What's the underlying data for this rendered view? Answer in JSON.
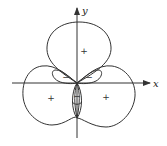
{
  "diagram": {
    "type": "polar-curve-sign-regions",
    "axes": {
      "x_label": "x",
      "y_label": "y"
    },
    "regions": [
      {
        "id": "top-lobe",
        "sign": "+"
      },
      {
        "id": "left-lobe",
        "sign": "+"
      },
      {
        "id": "right-lobe",
        "sign": "+"
      },
      {
        "id": "upper-left-inner-loop",
        "sign": "−"
      },
      {
        "id": "upper-right-inner-loop",
        "sign": "−"
      },
      {
        "id": "bottom-inner-loop",
        "sign": "−"
      }
    ],
    "colors": {
      "stroke": "#333333",
      "background": "#ffffff"
    }
  }
}
